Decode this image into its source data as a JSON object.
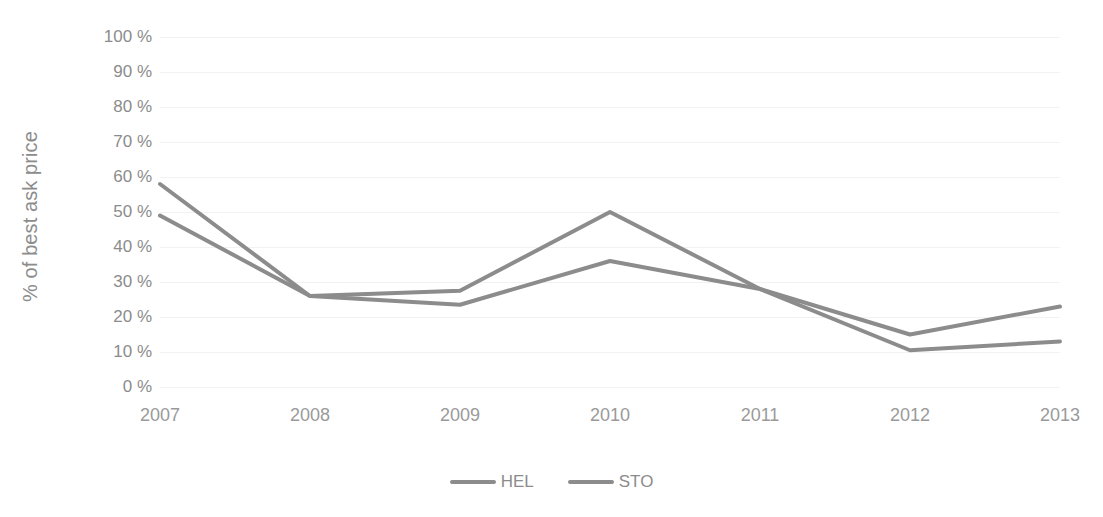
{
  "chart_data": {
    "type": "line",
    "title": "",
    "xlabel": "",
    "ylabel": "% of best ask price",
    "categories": [
      "2007",
      "2008",
      "2009",
      "2010",
      "2011",
      "2012",
      "2013"
    ],
    "series": [
      {
        "name": "HEL",
        "color": "#8c8c8c",
        "values": [
          49,
          26,
          27.5,
          50,
          28,
          15,
          23
        ]
      },
      {
        "name": "STO",
        "color": "#8c8c8c",
        "values": [
          58,
          26,
          23.5,
          36,
          28,
          10.5,
          13
        ]
      }
    ],
    "ylim": [
      0,
      100
    ],
    "ytick_values": [
      0,
      10,
      20,
      30,
      40,
      50,
      60,
      70,
      80,
      90,
      100
    ],
    "ytick_labels": [
      "0 %",
      "10 %",
      "20 %",
      "30 %",
      "40 %",
      "50 %",
      "60 %",
      "70 %",
      "80 %",
      "90 %",
      "100 %"
    ],
    "grid": true,
    "grid_color": "#f2f2f2",
    "legend_position": "bottom",
    "legend_entries": [
      "HEL",
      "STO"
    ],
    "axis_text_color": "#8c8c8c",
    "background_color": "#ffffff"
  }
}
